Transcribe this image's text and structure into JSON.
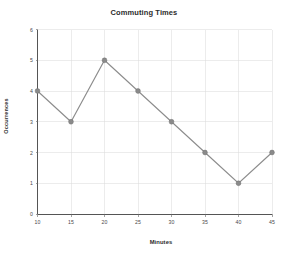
{
  "chart_data": {
    "type": "line",
    "title": "Commuting Times",
    "xlabel": "Minutes",
    "ylabel": "Occurrences",
    "x": [
      10,
      15,
      20,
      25,
      30,
      35,
      40,
      45
    ],
    "values": [
      4,
      3,
      5,
      4,
      3,
      2,
      1,
      2
    ],
    "series": [
      {
        "name": "Occurrences",
        "values": [
          4,
          3,
          5,
          4,
          3,
          2,
          1,
          2
        ]
      }
    ],
    "xlim": [
      10,
      45
    ],
    "ylim": [
      0,
      6
    ],
    "xticks": [
      "10",
      "15",
      "20",
      "25",
      "30",
      "35",
      "40",
      "45"
    ],
    "yticks": [
      "0",
      "1",
      "2",
      "3",
      "4",
      "5",
      "6"
    ],
    "grid": true,
    "legend": false,
    "marker": "circle",
    "colors": {
      "line": "#8c8c8c",
      "marker": "#8a8a8a",
      "grid": "#d9d9d9",
      "axis": "#555555",
      "background": "#ffffff",
      "text": "#2b2b2b"
    }
  }
}
